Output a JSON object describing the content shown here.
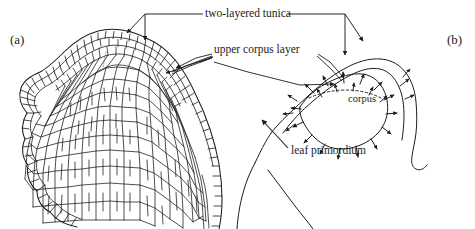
{
  "figure": {
    "width": 475,
    "height": 229,
    "background_color": "#ffffff",
    "ink_color": "#1c1c1c"
  },
  "panels": [
    {
      "id": "a",
      "label": "(a)",
      "description": "cellular cross-section drawing of shoot apex"
    },
    {
      "id": "b",
      "label": "(b)",
      "description": "schematic of apical dome with growth direction arrows"
    }
  ],
  "callouts": [
    {
      "id": "two-layered-tunica",
      "text": "two-layered tunica"
    },
    {
      "id": "upper-corpus-layer",
      "text": "upper corpus layer"
    },
    {
      "id": "leaf-primordium",
      "text": "leaf primordium"
    }
  ],
  "inner_labels": [
    {
      "id": "corpus",
      "text": "corpus"
    }
  ]
}
